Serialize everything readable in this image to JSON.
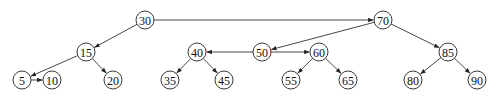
{
  "diagram": {
    "type": "binary tree with threaded/linked edges",
    "node_radius": 9,
    "nodes": [
      {
        "id": "30",
        "label": "30",
        "x": 145,
        "y": 20
      },
      {
        "id": "70",
        "label": "70",
        "x": 383,
        "y": 20
      },
      {
        "id": "15",
        "label": "15",
        "x": 86,
        "y": 52
      },
      {
        "id": "40",
        "label": "40",
        "x": 197,
        "y": 52
      },
      {
        "id": "50",
        "label": "50",
        "x": 262,
        "y": 52
      },
      {
        "id": "60",
        "label": "60",
        "x": 319,
        "y": 52
      },
      {
        "id": "85",
        "label": "85",
        "x": 448,
        "y": 52
      },
      {
        "id": "5",
        "label": "5",
        "x": 22,
        "y": 80
      },
      {
        "id": "10",
        "label": "10",
        "x": 52,
        "y": 80
      },
      {
        "id": "20",
        "label": "20",
        "x": 113,
        "y": 80
      },
      {
        "id": "35",
        "label": "35",
        "x": 170,
        "y": 80
      },
      {
        "id": "45",
        "label": "45",
        "x": 224,
        "y": 80
      },
      {
        "id": "55",
        "label": "55",
        "x": 291,
        "y": 80
      },
      {
        "id": "65",
        "label": "65",
        "x": 348,
        "y": 80
      },
      {
        "id": "80",
        "label": "80",
        "x": 413,
        "y": 80
      },
      {
        "id": "90",
        "label": "90",
        "x": 477,
        "y": 80
      }
    ],
    "edges": [
      {
        "from": "30",
        "to": "70",
        "arrow": true
      },
      {
        "from": "30",
        "to": "15",
        "arrow": true
      },
      {
        "from": "15",
        "to": "5",
        "arrow": true
      },
      {
        "from": "15",
        "to": "20",
        "arrow": true
      },
      {
        "from": "5",
        "to": "10",
        "arrow": true
      },
      {
        "from": "70",
        "to": "50",
        "arrow": true
      },
      {
        "from": "70",
        "to": "85",
        "arrow": true
      },
      {
        "from": "50",
        "to": "40",
        "arrow": true
      },
      {
        "from": "50",
        "to": "60",
        "arrow": true
      },
      {
        "from": "40",
        "to": "35",
        "arrow": true
      },
      {
        "from": "40",
        "to": "45",
        "arrow": true
      },
      {
        "from": "60",
        "to": "55",
        "arrow": true
      },
      {
        "from": "60",
        "to": "65",
        "arrow": true
      },
      {
        "from": "85",
        "to": "80",
        "arrow": true
      },
      {
        "from": "85",
        "to": "90",
        "arrow": true
      }
    ],
    "colors": {
      "stroke": "#222222",
      "fill": "#ffffff",
      "text": "#111111"
    }
  }
}
